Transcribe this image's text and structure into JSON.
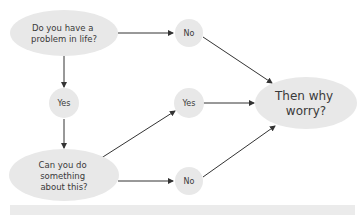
{
  "diagram": {
    "type": "flowchart",
    "colors": {
      "node_fill": "#e8e8e8",
      "arrow": "#333333",
      "text": "#3a3a3a",
      "bar": "#ebebeb"
    },
    "nodes": {
      "question1": {
        "lines": [
          "Do you have a",
          "problem in life?"
        ]
      },
      "no_top": {
        "label": "No"
      },
      "yes_left": {
        "label": "Yes"
      },
      "yes_right": {
        "label": "Yes"
      },
      "question2": {
        "lines": [
          "Can you do",
          "something",
          "about this?"
        ]
      },
      "no_bottom": {
        "label": "No"
      },
      "conclusion": {
        "lines": [
          "Then why",
          "worry?"
        ]
      }
    },
    "edges": [
      {
        "from": "question1",
        "to": "no_top"
      },
      {
        "from": "question1",
        "to": "yes_left"
      },
      {
        "from": "yes_left",
        "to": "question2"
      },
      {
        "from": "question2",
        "to": "yes_right"
      },
      {
        "from": "question2",
        "to": "no_bottom"
      },
      {
        "from": "no_top",
        "to": "conclusion"
      },
      {
        "from": "yes_right",
        "to": "conclusion"
      },
      {
        "from": "no_bottom",
        "to": "conclusion"
      }
    ]
  }
}
